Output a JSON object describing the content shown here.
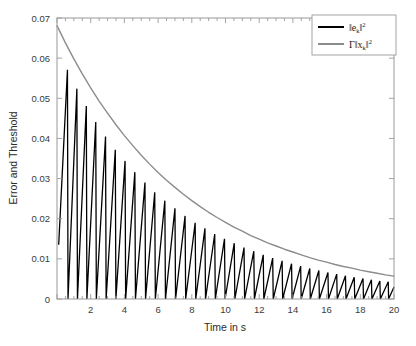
{
  "chart_data": {
    "type": "line",
    "title": "",
    "xlabel": "Time in s",
    "ylabel": "Error and Threshold",
    "xlim": [
      0,
      20
    ],
    "ylim": [
      0,
      0.07
    ],
    "grid": false,
    "legend_position": "top-right",
    "xticks": [
      0,
      2,
      4,
      6,
      8,
      10,
      12,
      14,
      16,
      18,
      20
    ],
    "xticklabels": [
      "",
      "2",
      "4",
      "6",
      "8",
      "10",
      "12",
      "14",
      "16",
      "18",
      "20"
    ],
    "yticks": [
      0,
      0.01,
      0.02,
      0.03,
      0.04,
      0.05,
      0.06,
      0.07
    ],
    "yticklabels": [
      "0",
      "0.01",
      "0.02",
      "0.03",
      "0.04",
      "0.05",
      "0.06",
      "0.07"
    ],
    "series": [
      {
        "name": "error",
        "legend_text": "‖e_k‖²",
        "legend_base": "‖e",
        "legend_sub": "k",
        "legend_mid": "‖",
        "legend_sup": "2",
        "color": "#000000",
        "width": 1.4,
        "description": "Sawtooth event-triggered error, resets to 0 at each trigger, peaks decay exponentially just below the threshold envelope",
        "peak_times": [
          0.62,
          1.18,
          1.74,
          2.3,
          2.88,
          3.46,
          4.04,
          4.62,
          5.22,
          5.8,
          6.4,
          7.0,
          7.6,
          8.2,
          8.78,
          9.36,
          9.94,
          10.52,
          11.1,
          11.68,
          12.24,
          12.8,
          13.36,
          13.92,
          14.46,
          15.0,
          15.54,
          16.08,
          16.6,
          17.12,
          17.64,
          18.16,
          18.66,
          19.16,
          19.66
        ],
        "peak_values": [
          0.0571,
          0.0524,
          0.0481,
          0.0441,
          0.0405,
          0.0372,
          0.0344,
          0.0316,
          0.029,
          0.0266,
          0.0245,
          0.0226,
          0.0207,
          0.019,
          0.0176,
          0.0162,
          0.015,
          0.0139,
          0.0128,
          0.0119,
          0.011,
          0.0102,
          0.0095,
          0.0088,
          0.0082,
          0.0076,
          0.0071,
          0.0066,
          0.0062,
          0.0058,
          0.0054,
          0.0051,
          0.0048,
          0.0045,
          0.0043
        ],
        "start_value": 0.0135,
        "start_time": 0.1
      },
      {
        "name": "threshold",
        "legend_text": "Γ‖x_k‖²",
        "legend_gamma": "Γ",
        "legend_base": "‖x",
        "legend_sub": "k",
        "legend_mid": "‖",
        "legend_sup": "2",
        "color": "#8c8c8c",
        "width": 1.4,
        "description": "Smooth exponentially decaying threshold envelope",
        "x": [
          0.0,
          0.5,
          1.0,
          1.5,
          2.0,
          2.5,
          3.0,
          3.5,
          4.0,
          4.5,
          5.0,
          5.5,
          6.0,
          6.5,
          7.0,
          7.5,
          8.0,
          8.5,
          9.0,
          9.5,
          10.0,
          10.5,
          11.0,
          11.5,
          12.0,
          12.5,
          13.0,
          13.5,
          14.0,
          14.5,
          15.0,
          15.5,
          16.0,
          16.5,
          17.0,
          17.5,
          18.0,
          18.5,
          19.0,
          19.5,
          20.0
        ],
        "y": [
          0.0681,
          0.0638,
          0.0598,
          0.0561,
          0.0526,
          0.0493,
          0.0463,
          0.0434,
          0.0407,
          0.0382,
          0.0358,
          0.0336,
          0.0315,
          0.0296,
          0.0278,
          0.0261,
          0.0245,
          0.023,
          0.0216,
          0.0203,
          0.0191,
          0.0179,
          0.0169,
          0.0158,
          0.0149,
          0.014,
          0.0132,
          0.0124,
          0.0117,
          0.011,
          0.0103,
          0.0097,
          0.0092,
          0.0086,
          0.0081,
          0.0077,
          0.0072,
          0.0068,
          0.0064,
          0.006,
          0.0057
        ]
      }
    ]
  },
  "axes": {
    "box_color": "#9a9a9a",
    "background": "#ffffff"
  },
  "legend": {
    "entries": [
      {
        "label": "‖e_k‖²",
        "color": "#000000"
      },
      {
        "label": "Γ‖x_k‖²",
        "color": "#8c8c8c"
      }
    ],
    "border_color": "#9a9a9a"
  }
}
